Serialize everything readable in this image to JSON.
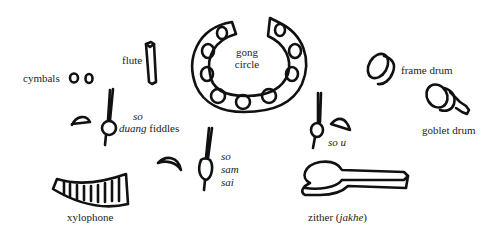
{
  "diagram": {
    "labels": {
      "cymbals": "cymbals",
      "flute": "flute",
      "gong_line1": "gong",
      "gong_line2": "circle",
      "frame_drum": "frame drum",
      "goblet_drum": "goblet drum",
      "so_duang_1": "so",
      "so_duang_2": "duang",
      "so_duang_3": "fiddles",
      "so_sam_sai_1": "so",
      "so_sam_sai_2": "sam",
      "so_sam_sai_3": "sai",
      "so_u": "so u",
      "xylophone": "xylophone",
      "zither_main": "zither (",
      "zither_italic": "jakhe",
      "zither_close": ")"
    },
    "instruments": [
      {
        "name": "cymbals",
        "icon": "cymbals-icon"
      },
      {
        "name": "flute",
        "icon": "flute-icon"
      },
      {
        "name": "gong circle",
        "icon": "gong-circle-icon"
      },
      {
        "name": "frame drum",
        "icon": "frame-drum-icon"
      },
      {
        "name": "goblet drum",
        "icon": "goblet-drum-icon"
      },
      {
        "name": "so duang fiddles",
        "icon": "fiddle-icon"
      },
      {
        "name": "so sam sai",
        "icon": "fiddle-icon"
      },
      {
        "name": "so u",
        "icon": "fiddle-icon"
      },
      {
        "name": "xylophone",
        "icon": "xylophone-icon"
      },
      {
        "name": "zither (jakhe)",
        "icon": "zither-icon"
      }
    ]
  }
}
